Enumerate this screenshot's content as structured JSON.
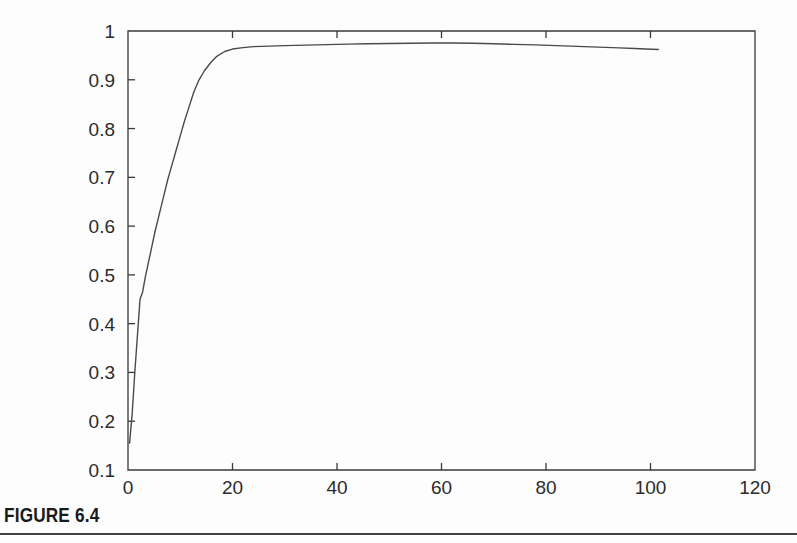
{
  "figure": {
    "caption_label": "FIGURE 6.4",
    "background_color": "#fdfdfd",
    "line_color": "#4a4a4a",
    "axis_color": "#3a3a3a"
  },
  "chart_data": {
    "type": "line",
    "title": "",
    "subtitle": "",
    "xlabel": "",
    "ylabel": "",
    "xlim": [
      0,
      120
    ],
    "ylim": [
      0.1,
      1
    ],
    "xticks": [
      0,
      20,
      40,
      60,
      80,
      100,
      120
    ],
    "yticks": [
      0.1,
      0.2,
      0.3,
      0.4,
      0.5,
      0.6,
      0.7,
      0.8,
      0.9,
      1
    ],
    "xtick_labels": [
      "0",
      "20",
      "40",
      "60",
      "80",
      "100",
      "120"
    ],
    "ytick_labels": [
      "0.1",
      "0.2",
      "0.3",
      "0.4",
      "0.5",
      "0.6",
      "0.7",
      "0.8",
      "0.9",
      "1"
    ],
    "grid": false,
    "legend": null,
    "legend_position": "none",
    "annotations": [],
    "series": [
      {
        "name": "curve",
        "color": "#4a4a4a",
        "x": [
          0.3,
          0.8,
          1.3,
          1.8,
          2.3,
          2.8,
          3.3,
          3.9,
          4.5,
          5.2,
          6.0,
          6.8,
          7.6,
          8.4,
          9.2,
          10.0,
          10.8,
          11.7,
          12.6,
          13.6,
          14.6,
          15.8,
          17.0,
          18.5,
          20.0,
          22.0,
          24.0,
          27.0,
          30.0,
          34.0,
          38.0,
          42.0,
          46.0,
          50.0,
          54.0,
          58.0,
          62.0,
          66.0,
          70.0,
          74.0,
          78.0,
          82.0,
          86.0,
          90.0,
          94.0,
          97.0,
          99.0,
          100.3,
          101.5
        ],
        "y": [
          0.155,
          0.215,
          0.3,
          0.375,
          0.45,
          0.465,
          0.495,
          0.525,
          0.555,
          0.59,
          0.625,
          0.66,
          0.695,
          0.725,
          0.755,
          0.785,
          0.815,
          0.845,
          0.875,
          0.9,
          0.918,
          0.935,
          0.948,
          0.958,
          0.963,
          0.966,
          0.968,
          0.969,
          0.97,
          0.971,
          0.972,
          0.973,
          0.974,
          0.9745,
          0.975,
          0.9755,
          0.9755,
          0.975,
          0.974,
          0.9725,
          0.9715,
          0.97,
          0.9685,
          0.967,
          0.9655,
          0.964,
          0.963,
          0.9625,
          0.962
        ]
      }
    ]
  }
}
